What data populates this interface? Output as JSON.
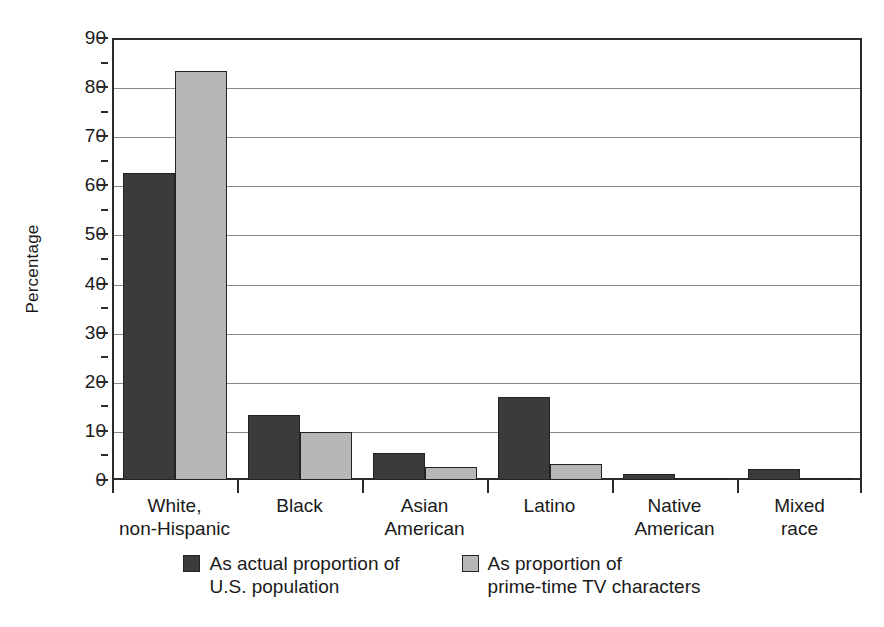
{
  "chart_data": {
    "type": "bar",
    "title": "",
    "subtitle": "",
    "xlabel": "",
    "ylabel": "Percentage",
    "ylim": [
      0,
      90
    ],
    "ytick_step": 10,
    "yticks": [
      "0",
      "10",
      "20",
      "30",
      "40",
      "50",
      "60",
      "70",
      "80",
      "90"
    ],
    "grid": true,
    "legend_position": "bottom",
    "categories": [
      {
        "line1": "White,",
        "line2": "non-Hispanic"
      },
      {
        "line1": "Black",
        "line2": ""
      },
      {
        "line1": "Asian",
        "line2": "American"
      },
      {
        "line1": "Latino",
        "line2": ""
      },
      {
        "line1": "Native",
        "line2": "American"
      },
      {
        "line1": "Mixed",
        "line2": "race"
      }
    ],
    "series": [
      {
        "name": "As actual proportion of U.S. population",
        "legend_line1": "As actual proportion of",
        "legend_line2": "U.S. population",
        "color": "#3b3b3b",
        "values": [
          62.5,
          13.2,
          5.5,
          17.0,
          1.2,
          2.3
        ]
      },
      {
        "name": "As proportion of prime-time TV characters",
        "legend_line1": "As proportion of",
        "legend_line2": "prime-time TV characters",
        "color": "#b7b7b7",
        "values": [
          83.3,
          9.8,
          2.7,
          3.2,
          0.1,
          0.5
        ]
      }
    ],
    "colors": {
      "dark_series": "#3b3b3b",
      "light_series": "#b7b7b7",
      "axis": "#2b2b2b",
      "gridline": "#8a8a8a",
      "background": "#ffffff"
    }
  }
}
